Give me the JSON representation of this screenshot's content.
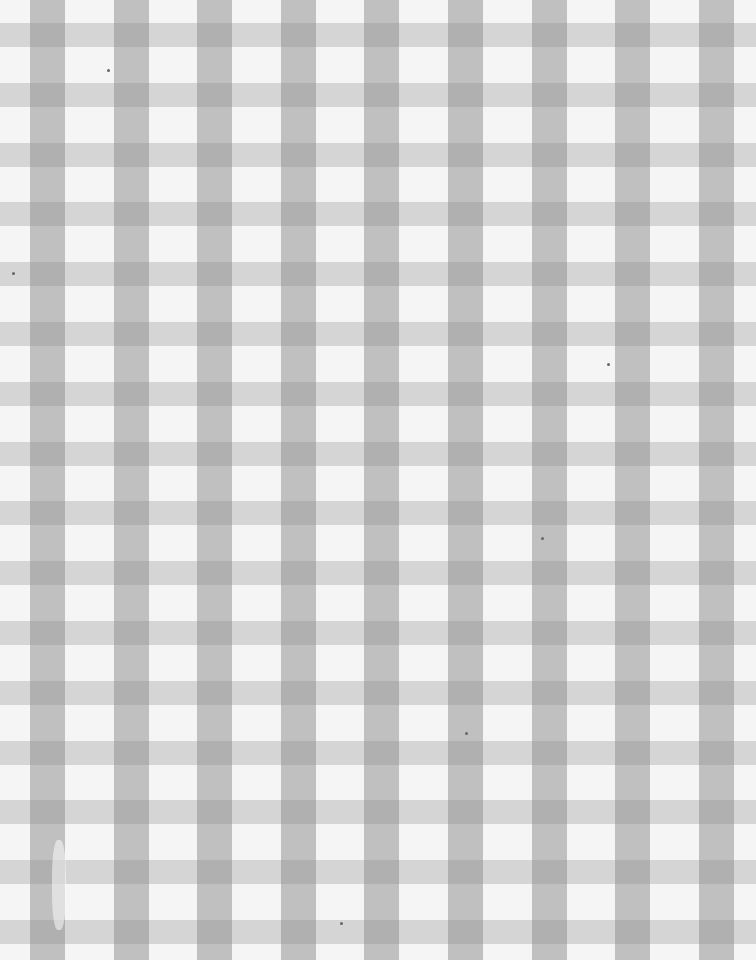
{
  "image": {
    "subject": "gingham-checkered-fabric",
    "width": 756,
    "height": 960,
    "pattern": {
      "vertical_stripe_width": 35,
      "vertical_stripe_period": 83.6,
      "vertical_stripe_offset": 30,
      "horizontal_band_height": 24,
      "horizontal_band_period": 59.8,
      "horizontal_band_offset": 23
    },
    "colors": {
      "background": "#f5f5f5",
      "light_band": "#d8d8d8",
      "stripe": "#b4b4b4",
      "intersection": "#959595"
    },
    "specks": [
      {
        "x": 607,
        "y": 363
      },
      {
        "x": 541,
        "y": 537
      },
      {
        "x": 465,
        "y": 732
      },
      {
        "x": 340,
        "y": 922
      },
      {
        "x": 107,
        "y": 69
      },
      {
        "x": 12,
        "y": 272
      }
    ]
  }
}
